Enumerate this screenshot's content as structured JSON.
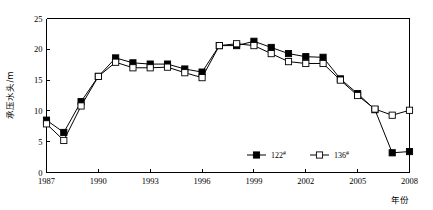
{
  "chart_data": {
    "type": "line",
    "title": "",
    "xlabel": "年份",
    "ylabel": "承压水头/m",
    "xlim": [
      1987,
      2008
    ],
    "ylim": [
      0,
      25
    ],
    "grid": false,
    "legend_position": "inside-bottom-right",
    "x_ticks": [
      "1987",
      "1990",
      "1993",
      "1996",
      "1999",
      "2002",
      "2005",
      "2008"
    ],
    "x_tick_values": [
      1987,
      1990,
      1993,
      1996,
      1999,
      2002,
      2005,
      2008
    ],
    "y_ticks": [
      "0",
      "5",
      "10",
      "15",
      "20",
      "25"
    ],
    "y_tick_values": [
      0,
      5,
      10,
      15,
      20,
      25
    ],
    "x": [
      1987,
      1988,
      1989,
      1990,
      1991,
      1992,
      1993,
      1994,
      1995,
      1996,
      1997,
      1998,
      1999,
      2000,
      2001,
      2002,
      2003,
      2004,
      2005,
      2006,
      2007,
      2008
    ],
    "series": [
      {
        "name": "122#",
        "label": "122",
        "superscript": "#",
        "marker": "filled-square",
        "color": "#000000",
        "values": [
          8.5,
          6.5,
          11.5,
          15.6,
          18.6,
          17.8,
          17.6,
          17.6,
          16.8,
          16.3,
          20.6,
          20.6,
          21.3,
          20.3,
          19.3,
          18.8,
          18.7,
          15.2,
          12.8,
          10.2,
          3.2,
          3.4
        ]
      },
      {
        "name": "136#",
        "label": "136",
        "superscript": "#",
        "marker": "open-square",
        "color": "#000000",
        "values": [
          7.9,
          5.2,
          10.8,
          15.6,
          17.9,
          17.0,
          17.0,
          17.1,
          16.2,
          15.4,
          20.6,
          20.9,
          20.6,
          19.3,
          18.0,
          17.7,
          17.7,
          15.0,
          12.5,
          10.3,
          9.3,
          10.1
        ]
      }
    ]
  }
}
